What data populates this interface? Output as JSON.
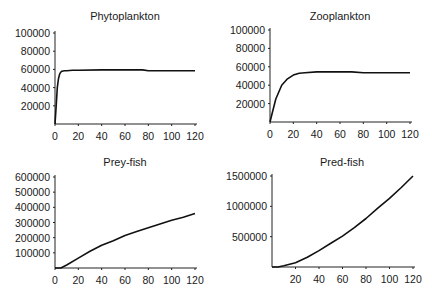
{
  "chart_data": [
    {
      "type": "line",
      "title": "Phytoplankton",
      "xlabel": "",
      "ylabel": "",
      "xlim": [
        0,
        120
      ],
      "ylim": [
        0,
        100000
      ],
      "xticks": [
        0,
        20,
        40,
        60,
        80,
        100,
        120
      ],
      "yticks": [
        20000,
        40000,
        60000,
        80000,
        100000
      ],
      "ytick_labels": [
        "20000",
        "40000",
        "60000",
        "80000",
        "100000"
      ],
      "xtick_labels": [
        "0",
        "20",
        "40",
        "60",
        "80",
        "100",
        "120"
      ],
      "grid": false,
      "x": [
        0,
        1,
        2,
        3,
        4,
        5,
        6,
        8,
        10,
        15,
        20,
        40,
        60,
        75,
        80,
        100,
        120
      ],
      "values": [
        0,
        20000,
        40000,
        50000,
        55000,
        57000,
        58000,
        58500,
        58500,
        59000,
        59000,
        59500,
        59500,
        59500,
        58500,
        58500,
        58500
      ]
    },
    {
      "type": "line",
      "title": "Zooplankton",
      "xlabel": "",
      "ylabel": "",
      "xlim": [
        0,
        120
      ],
      "ylim": [
        0,
        100000
      ],
      "xticks": [
        0,
        20,
        40,
        60,
        80,
        100,
        120
      ],
      "yticks": [
        20000,
        40000,
        60000,
        80000,
        100000
      ],
      "ytick_labels": [
        "20000",
        "40000",
        "60000",
        "80000",
        "100000"
      ],
      "xtick_labels": [
        "0",
        "20",
        "40",
        "60",
        "80",
        "100",
        "120"
      ],
      "grid": false,
      "x": [
        0,
        2,
        5,
        10,
        15,
        20,
        25,
        30,
        40,
        50,
        60,
        70,
        80,
        100,
        120
      ],
      "values": [
        0,
        10000,
        25000,
        40000,
        47000,
        51000,
        53000,
        53500,
        54500,
        54500,
        54500,
        54500,
        53500,
        53500,
        53500
      ]
    },
    {
      "type": "line",
      "title": "Prey-fish",
      "xlabel": "",
      "ylabel": "",
      "xlim": [
        0,
        120
      ],
      "ylim": [
        0,
        600000
      ],
      "xticks": [
        0,
        20,
        40,
        60,
        80,
        100,
        120
      ],
      "yticks": [
        100000,
        200000,
        300000,
        400000,
        500000,
        600000
      ],
      "ytick_labels": [
        "100000",
        "200000",
        "300000",
        "400000",
        "500000",
        "600000"
      ],
      "xtick_labels": [
        "0",
        "20",
        "40",
        "60",
        "80",
        "100",
        "120"
      ],
      "grid": false,
      "x": [
        0,
        5,
        10,
        20,
        30,
        40,
        50,
        60,
        70,
        80,
        90,
        100,
        110,
        120
      ],
      "values": [
        0,
        0,
        20000,
        65000,
        110000,
        150000,
        180000,
        215000,
        240000,
        265000,
        290000,
        315000,
        335000,
        360000
      ]
    },
    {
      "type": "line",
      "title": "Pred-fish",
      "xlabel": "",
      "ylabel": "",
      "xlim": [
        0,
        120
      ],
      "ylim": [
        0,
        1500000
      ],
      "xticks": [
        20,
        40,
        60,
        80,
        100,
        120
      ],
      "yticks": [
        500000,
        1000000,
        1500000
      ],
      "ytick_labels": [
        "500000",
        "1000000",
        "1500000"
      ],
      "xtick_labels": [
        "20",
        "40",
        "60",
        "80",
        "100",
        "120"
      ],
      "grid": false,
      "x": [
        0,
        5,
        10,
        20,
        30,
        40,
        50,
        60,
        70,
        80,
        90,
        100,
        110,
        120
      ],
      "values": [
        0,
        0,
        20000,
        70000,
        160000,
        270000,
        390000,
        510000,
        650000,
        800000,
        970000,
        1130000,
        1310000,
        1500000
      ]
    }
  ]
}
